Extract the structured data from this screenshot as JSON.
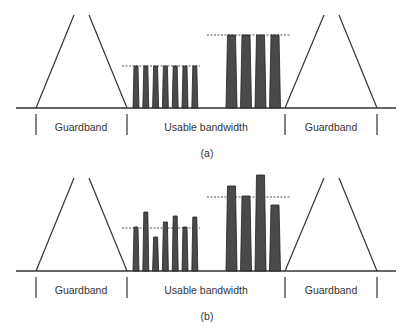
{
  "colors": {
    "line": "#333333",
    "bar_fill": "#4a4a4a",
    "bar_stroke": "#222222",
    "dotted": "#555555"
  },
  "panels": [
    {
      "id": "a",
      "caption": "(a)",
      "labels": {
        "left_guardband": "Guardband",
        "usable": "Usable bandwidth",
        "right_guardband": "Guardband"
      },
      "narrow_bar_tops": [
        66,
        66,
        66,
        66,
        66,
        66,
        66
      ],
      "wide_bar_tops": [
        35,
        35,
        35,
        35
      ],
      "narrow_level": 66,
      "wide_level": 35
    },
    {
      "id": "b",
      "caption": "(b)",
      "labels": {
        "left_guardband": "Guardband",
        "usable": "Usable bandwidth",
        "right_guardband": "Guardband"
      },
      "narrow_bar_tops": [
        227,
        212,
        237,
        222,
        216,
        227,
        217
      ],
      "wide_bar_tops": [
        186,
        196,
        175,
        205
      ],
      "narrow_level": 228,
      "wide_level": 197
    }
  ]
}
